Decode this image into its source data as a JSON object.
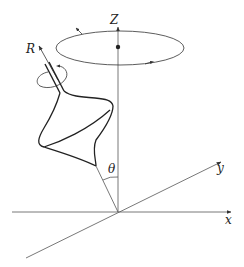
{
  "diagram": {
    "labels": {
      "z_axis": "Z",
      "x_axis": "x",
      "y_axis": "y",
      "spin_axis": "R",
      "tilt_angle": "θ"
    },
    "elements": [
      "Z axis (vertical)",
      "x axis (horizontal)",
      "y axis (diagonal, perspective)",
      "precession ellipse around Z axis with direction arrows",
      "center of mass dot on Z axis",
      "spinning top with symmetry axis R tilted by angle θ from Z",
      "spin rotation arrow around R axis"
    ],
    "colors": {
      "line": "#333333",
      "axis": "#555555",
      "background": "#ffffff"
    }
  }
}
